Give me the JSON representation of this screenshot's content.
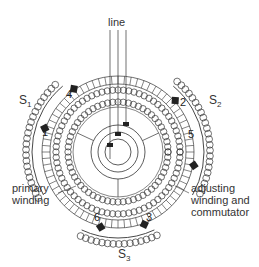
{
  "diagram": {
    "labels": {
      "line": "line",
      "s1": "S",
      "s1_sub": "1",
      "s2": "S",
      "s2_sub": "2",
      "s3": "S",
      "s3_sub": "3",
      "primary_winding": "primary\nwinding",
      "adjusting": "adjusting\nwinding and\ncommutator"
    },
    "brushes": [
      "1",
      "2",
      "3",
      "4",
      "5",
      "6"
    ],
    "colors": {
      "ink": "#333333",
      "background": "#ffffff"
    }
  }
}
